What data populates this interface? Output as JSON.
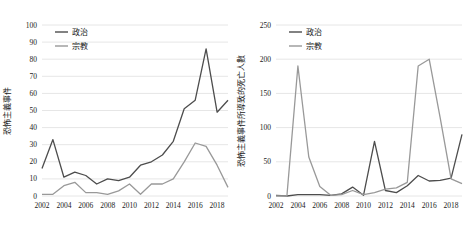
{
  "figure": {
    "background": "#ffffff",
    "text_color": "#1a1a1a",
    "gridline_color": "#e6e6e6"
  },
  "legend": {
    "items": [
      {
        "label": "政治",
        "color": "#4d4d4d"
      },
      {
        "label": "宗教",
        "color": "#999999"
      }
    ],
    "position": "top-left-inside"
  },
  "chart_data": [
    {
      "type": "line",
      "title": "",
      "xlabel": "",
      "ylabel": "恐怖主義事件",
      "x": [
        2002,
        2003,
        2004,
        2005,
        2006,
        2007,
        2008,
        2009,
        2010,
        2011,
        2012,
        2013,
        2014,
        2015,
        2016,
        2017,
        2018,
        2019
      ],
      "xticks": [
        2002,
        2004,
        2006,
        2008,
        2010,
        2012,
        2014,
        2016,
        2018
      ],
      "ylim": [
        0,
        100
      ],
      "ytick_step": 10,
      "grid": "horizontal",
      "legend_position": "top-left-inside",
      "series": [
        {
          "name": "政治",
          "color": "#4d4d4d",
          "values": [
            16,
            33,
            11,
            14,
            12,
            7,
            10,
            9,
            11,
            18,
            20,
            24,
            32,
            51,
            56,
            86,
            49,
            56
          ]
        },
        {
          "name": "宗教",
          "color": "#999999",
          "values": [
            1,
            1,
            6,
            8,
            2,
            2,
            1,
            3,
            7,
            1,
            7,
            7,
            10,
            20,
            31,
            29,
            18,
            5
          ]
        }
      ]
    },
    {
      "type": "line",
      "title": "",
      "xlabel": "",
      "ylabel": "恐怖主義事件所導致的死亡人數",
      "x": [
        2002,
        2003,
        2004,
        2005,
        2006,
        2007,
        2008,
        2009,
        2010,
        2011,
        2012,
        2013,
        2014,
        2015,
        2016,
        2017,
        2018,
        2019
      ],
      "xticks": [
        2002,
        2004,
        2006,
        2008,
        2010,
        2012,
        2014,
        2016,
        2018
      ],
      "ylim": [
        0,
        250
      ],
      "ytick_step": 50,
      "grid": "horizontal",
      "legend_position": "top-left-inside",
      "series": [
        {
          "name": "政治",
          "color": "#4d4d4d",
          "values": [
            1,
            0,
            2,
            2,
            2,
            1,
            3,
            13,
            1,
            80,
            8,
            5,
            15,
            30,
            22,
            23,
            26,
            90
          ]
        },
        {
          "name": "宗教",
          "color": "#999999",
          "values": [
            0,
            0,
            190,
            57,
            14,
            1,
            2,
            8,
            2,
            5,
            10,
            12,
            20,
            190,
            200,
            115,
            25,
            18
          ]
        }
      ]
    }
  ]
}
